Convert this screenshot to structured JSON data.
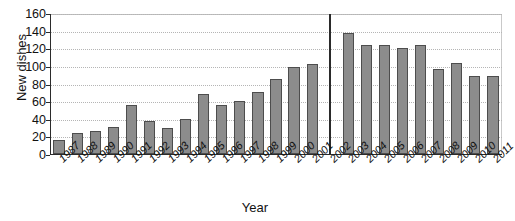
{
  "chart_data": {
    "type": "bar",
    "title": "",
    "xlabel": "Year",
    "ylabel": "New dishes",
    "ylim": [
      0,
      160
    ],
    "ytick_labels": [
      "0",
      "20",
      "40",
      "60",
      "80",
      "100",
      "120",
      "140",
      "160"
    ],
    "ytick_values": [
      0,
      20,
      40,
      60,
      80,
      100,
      120,
      140,
      160
    ],
    "grid": true,
    "legend": "none",
    "categories": [
      "1987",
      "1988",
      "1989",
      "1990",
      "1991",
      "1992",
      "1993",
      "1994",
      "1995",
      "1996",
      "1997",
      "1998",
      "1999",
      "2000",
      "2001",
      "2002",
      "2003",
      "2004",
      "2005",
      "2006",
      "2007",
      "2008",
      "2009",
      "2010",
      "2011"
    ],
    "values": [
      16,
      24,
      26,
      31,
      56,
      37,
      30,
      40,
      68,
      56,
      60,
      70,
      85,
      99,
      102,
      null,
      137,
      124,
      124,
      120,
      124,
      97,
      103,
      88,
      88
    ],
    "annotations": [
      {
        "name": "divider-line",
        "category": "2002",
        "description": "thin vertical line spanning full plot height at 2002",
        "value": 160
      }
    ],
    "bar_color": "#8c8c8c",
    "bar_edge_color": "#4d4d4d",
    "divider_color": "#2a2a2a",
    "grid_color": "#b5b5b5",
    "axis_color": "#2b2b2b"
  }
}
